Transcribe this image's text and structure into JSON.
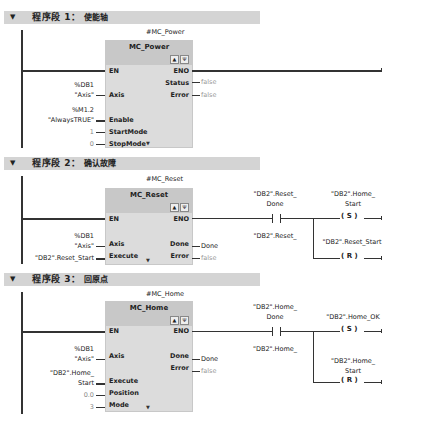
{
  "networks": [
    {
      "header_prefix": "程序段 1：",
      "header_comment": "使能轴",
      "instance": "#MC_Power",
      "block_name": "MC_Power",
      "inputs": [
        {
          "pin": "EN",
          "operand": ""
        },
        {
          "pin": "Axis",
          "operand_line1": "%DB1",
          "operand_line2": "\"Axis\""
        },
        {
          "pin": "Enable",
          "operand_line1": "%M1.2",
          "operand_line2": "\"AlwaysTRUE\""
        },
        {
          "pin": "StartMode",
          "operand": "1"
        },
        {
          "pin": "StopMode",
          "operand": "0"
        }
      ],
      "outputs": [
        {
          "pin": "ENO",
          "operand": ""
        },
        {
          "pin": "Status",
          "operand": "false"
        },
        {
          "pin": "Error",
          "operand": "false"
        }
      ]
    },
    {
      "header_prefix": "程序段 2：",
      "header_comment": "确认故障",
      "instance": "#MC_Reset",
      "block_name": "MC_Reset",
      "inputs": [
        {
          "pin": "EN",
          "operand": ""
        },
        {
          "pin": "Axis",
          "operand_line1": "%DB1",
          "operand_line2": "\"Axis\""
        },
        {
          "pin": "Execute",
          "operand": "\"DB2\".Reset_Start"
        }
      ],
      "outputs": [
        {
          "pin": "ENO",
          "operand": ""
        },
        {
          "pin": "Done",
          "operand_line1": "\"DB2\".Reset_",
          "operand_line2": "Done"
        },
        {
          "pin": "Error",
          "operand": "false"
        }
      ],
      "contact": {
        "line1": "\"DB2\".Reset_",
        "line2": "Done"
      },
      "coil_set": {
        "line1": "\"DB2\".Home_",
        "line2": "Start",
        "symbol": "S"
      },
      "coil_reset": {
        "line1": "\"DB2\".Reset_Start",
        "symbol": "R"
      }
    },
    {
      "header_prefix": "程序段 3：",
      "header_comment": "回原点",
      "instance": "#MC_Home",
      "block_name": "MC_Home",
      "inputs": [
        {
          "pin": "EN",
          "operand": ""
        },
        {
          "pin": "Axis",
          "operand_line1": "%DB1",
          "operand_line2": "\"Axis\""
        },
        {
          "pin": "Execute",
          "operand_line1": "\"DB2\".Home_",
          "operand_line2": "Start"
        },
        {
          "pin": "Position",
          "operand": "0.0"
        },
        {
          "pin": "Mode",
          "operand": "3"
        }
      ],
      "outputs": [
        {
          "pin": "ENO",
          "operand": ""
        },
        {
          "pin": "Done",
          "operand_line1": "\"DB2\".Home_",
          "operand_line2": "Done"
        },
        {
          "pin": "Error",
          "operand": "false"
        }
      ],
      "contact": {
        "line1": "\"DB2\".Home_",
        "line2": "Done"
      },
      "coil_set": {
        "line1": "\"DB2\".Home_OK",
        "symbol": "S"
      },
      "coil_reset": {
        "line1": "\"DB2\".Home_",
        "line2": "Start",
        "symbol": "R"
      }
    }
  ],
  "icons": {
    "collapse": "▼",
    "block_icon_1": "▲",
    "block_icon_2": "Ψ",
    "more": "▼",
    "coil_open": "(",
    "coil_close": ")"
  }
}
